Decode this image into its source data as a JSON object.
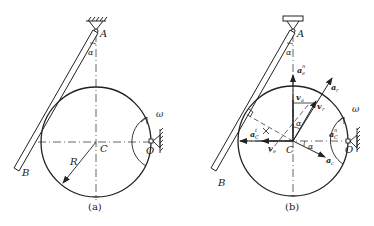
{
  "figure_a": {
    "caption": "(a)",
    "labels": {
      "A": "A",
      "B": "B",
      "C": "C",
      "O": "O",
      "R": "R",
      "alpha": "α",
      "omega": "ω"
    }
  },
  "figure_b": {
    "caption": "(b)",
    "labels": {
      "A": "A",
      "B": "B",
      "C": "C",
      "O": "O",
      "alpha_top": "α",
      "alpha_mid": "α",
      "alpha_right": "α",
      "omega": "ω",
      "a_e_n": "a",
      "a_e_n_sub": "e",
      "a_e_n_sup": "n",
      "a_r": "a",
      "a_r_sub": "r",
      "v_a": "v",
      "v_a_sub": "a",
      "v_r": "v",
      "v_r_sub": "r",
      "v_e": "v",
      "v_e_sub": "e",
      "a_C_t": "a",
      "a_C_t_sub": "C",
      "a_C_t_sup": "t",
      "a_C_n": "a",
      "a_C_n_sub": "C",
      "a_C_n_sup": "n",
      "a_c": "a",
      "a_c_sub": "c"
    }
  },
  "colors": {
    "line": "#222222",
    "background": "#ffffff"
  }
}
